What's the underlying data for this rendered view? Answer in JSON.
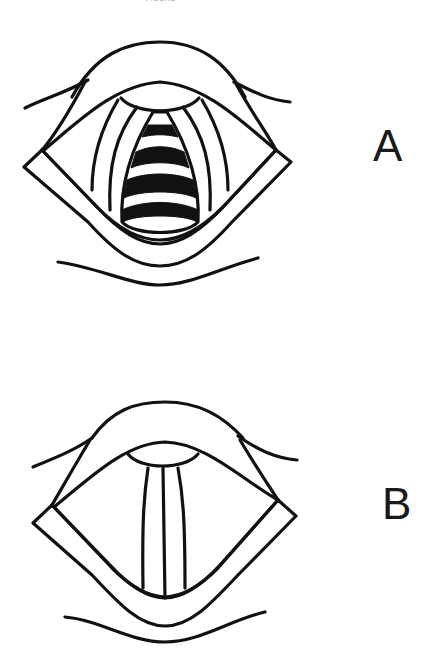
{
  "caption": "FIGURE",
  "panels": [
    {
      "id": "A",
      "label": "A",
      "description": "Laryngoscopic view: open glottis with tracheal rings visible",
      "tracheal_rings_visible": 4
    },
    {
      "id": "B",
      "label": "B",
      "description": "Laryngoscopic view: vocal cords adducted (closed glottis)"
    }
  ],
  "colors": {
    "ink": "#111111",
    "background": "#ffffff"
  }
}
